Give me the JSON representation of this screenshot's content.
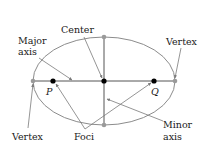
{
  "diagram": {
    "type": "ellipse",
    "colors": {
      "ellipse": "#8c8c8c",
      "axis": "#555555",
      "focus": "#000000",
      "vertex": "#9a9a9a",
      "pointer": "#7a7a7a",
      "text": "#1a1a1a"
    },
    "labels": {
      "center": "Center",
      "major_axis_line1": "Major",
      "major_axis_line2": "axis",
      "vertex_right": "Vertex",
      "vertex_left": "Vertex",
      "foci": "Foci",
      "minor_axis_line1": "Minor",
      "minor_axis_line2": "axis",
      "focus_p": "P",
      "focus_q": "Q"
    }
  }
}
